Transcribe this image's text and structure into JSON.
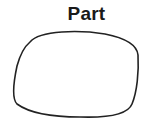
{
  "diagram": {
    "label": "Part",
    "shape": "closed-freeform-blob",
    "stroke_color": "#222222",
    "fill_color": "#ffffff"
  }
}
